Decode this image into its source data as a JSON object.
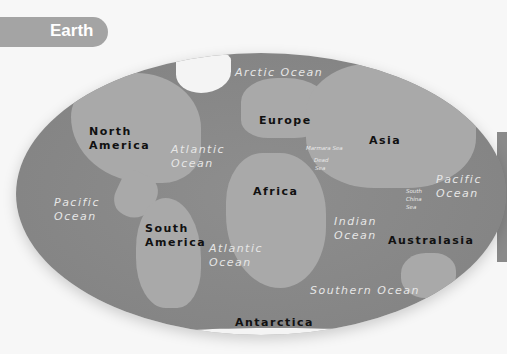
{
  "title": "Earth",
  "map": {
    "projection": "elliptical world relief map",
    "colors": {
      "ocean": "#858585",
      "land": "#a9a9a9",
      "ice": "#f4f4f4",
      "title_tab": "#a4a4a4"
    },
    "continents": {
      "north_america": [
        "North",
        "America"
      ],
      "south_america": [
        "South",
        "America"
      ],
      "europe": "Europe",
      "africa": "Africa",
      "asia": "Asia",
      "australasia": "Australasia",
      "antarctica": "Antarctica"
    },
    "oceans": {
      "arctic": "Arctic Ocean",
      "atlantic_north": [
        "Atlantic",
        "Ocean"
      ],
      "atlantic_south": [
        "Atlantic",
        "Ocean"
      ],
      "pacific_west": [
        "Pacific",
        "Ocean"
      ],
      "pacific_east": [
        "Pacific",
        "Ocean"
      ],
      "indian": [
        "Indian",
        "Ocean"
      ],
      "southern": "Southern Ocean"
    },
    "seas": {
      "marmara": "Marmara Sea",
      "dead": [
        "Dead",
        "Sea"
      ],
      "south_china": [
        "South",
        "China",
        "Sea"
      ]
    }
  }
}
